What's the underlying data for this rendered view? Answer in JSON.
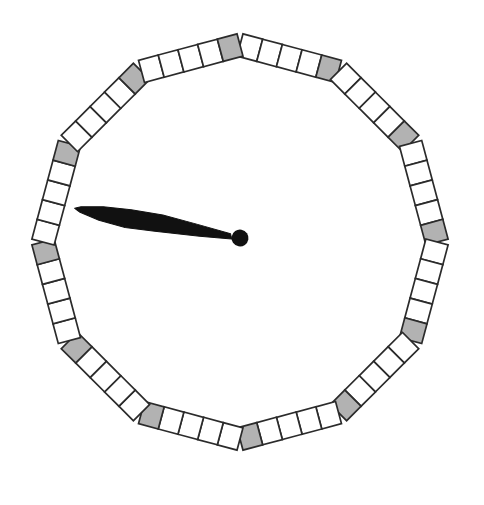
{
  "board": {
    "sides": 12,
    "squares_per_side": 5,
    "total_squares": 60,
    "gray_square_count": 12,
    "sides_pattern": [
      [
        "white",
        "white",
        "white",
        "white",
        "gray"
      ],
      [
        "white",
        "white",
        "white",
        "white",
        "gray"
      ],
      [
        "white",
        "white",
        "white",
        "white",
        "gray"
      ],
      [
        "white",
        "white",
        "white",
        "white",
        "gray"
      ],
      [
        "white",
        "white",
        "white",
        "white",
        "gray"
      ],
      [
        "white",
        "white",
        "white",
        "white",
        "gray"
      ],
      [
        "white",
        "white",
        "white",
        "white",
        "gray"
      ],
      [
        "white",
        "white",
        "white",
        "white",
        "gray"
      ],
      [
        "white",
        "white",
        "white",
        "white",
        "gray"
      ],
      [
        "white",
        "white",
        "white",
        "white",
        "gray"
      ],
      [
        "white",
        "white",
        "white",
        "white",
        "gray"
      ],
      [
        "white",
        "white",
        "white",
        "white",
        "gray"
      ]
    ],
    "colors": {
      "background": "#ffffff",
      "square_fill": "#ffffff",
      "gray_fill": "#b2b2b2",
      "outline": "#2b2b2b",
      "spinner": "#111111"
    },
    "geometry": {
      "center_x": 240,
      "center_y": 242,
      "vertex_radius": 197,
      "first_vertex_angle_deg": -90,
      "square_width": 20.4,
      "square_height": 23,
      "outline_width": 1.7
    }
  },
  "spinner": {
    "pivot_x": 240,
    "pivot_y": 238,
    "pivot_radius": 8.5,
    "angle_deg": 190.2,
    "length": 168,
    "shape_points": "8,-2.5 40,-5.5 85,-8.5 115,-10 142,-7.5 162,-3 168,0 162,2.5 140,6.5 112,8.5 80,9 45,6 10,2.5"
  }
}
